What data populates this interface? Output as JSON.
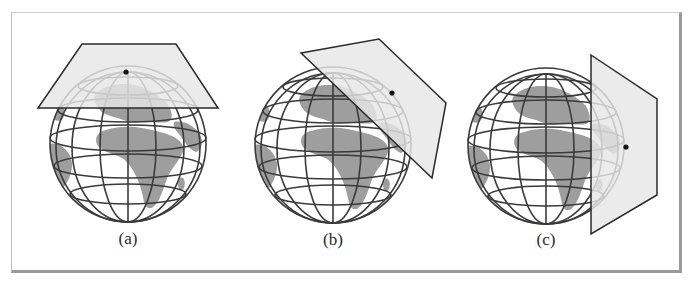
{
  "figure": {
    "panels": [
      {
        "id": "a",
        "caption": "(a)",
        "description": "Plane tangent at the pole (polar/normal aspect)"
      },
      {
        "id": "b",
        "caption": "(b)",
        "description": "Plane tangent at a mid-latitude point (oblique aspect)"
      },
      {
        "id": "c",
        "caption": "(c)",
        "description": "Plane tangent at the equator (equatorial/transverse aspect)"
      }
    ],
    "colors": {
      "land": "#9e9e9e",
      "ocean": "#ffffff",
      "graticule": "#3a3a3a",
      "plane_fill": "#e8e8e8",
      "plane_stroke": "#2a2a2a",
      "frame_shadow": "#9a9a9a"
    }
  }
}
